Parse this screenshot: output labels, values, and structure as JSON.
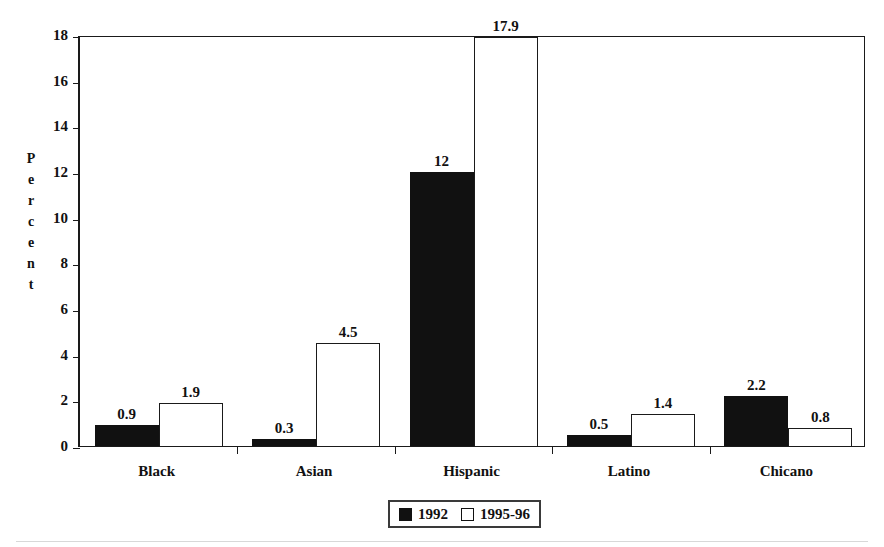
{
  "chart_data": {
    "type": "bar",
    "title": "",
    "subtitle": "",
    "xlabel": "",
    "ylabel": "Percent",
    "ylim": [
      0,
      18
    ],
    "ytick_labels": [
      "0",
      "2",
      "4",
      "6",
      "8",
      "10",
      "12",
      "14",
      "16",
      "18"
    ],
    "ytick_values": [
      0,
      2,
      4,
      6,
      8,
      10,
      12,
      14,
      16,
      18
    ],
    "grid": false,
    "legend_position": "bottom-center",
    "categories": [
      "Black",
      "Asian",
      "Hispanic",
      "Latino",
      "Chicano"
    ],
    "series": [
      {
        "name": "1992",
        "color": "#111111",
        "style": "filled",
        "values": [
          0.9,
          0.3,
          12,
          0.5,
          2.2
        ],
        "labels": [
          "0.9",
          "0.3",
          "12",
          "0.5",
          "2.2"
        ]
      },
      {
        "name": "1995-96",
        "color": "#ffffff",
        "style": "hollow",
        "values": [
          1.9,
          4.5,
          17.9,
          1.4,
          0.8
        ],
        "labels": [
          "1.9",
          "4.5",
          "17.9",
          "1.4",
          "0.8"
        ]
      }
    ]
  },
  "axis": {
    "y_title_letters": [
      "P",
      "e",
      "r",
      "c",
      "e",
      "n",
      "t"
    ]
  },
  "legend": {
    "items": [
      {
        "label": "1992",
        "swatch": "filled-square-icon"
      },
      {
        "label": "1995-96",
        "swatch": "hollow-square-icon"
      }
    ]
  },
  "colors": {
    "series_1992": "#111111",
    "series_1995_96": "#ffffff",
    "axis": "#1a1a1a",
    "background": "#ffffff"
  }
}
